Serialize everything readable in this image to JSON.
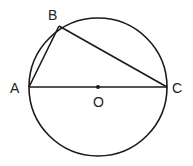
{
  "diagram": {
    "type": "geometry",
    "colors": {
      "stroke": "#1a1a1a",
      "label": "#222222",
      "background": "#ffffff"
    },
    "circle": {
      "center": "O",
      "cx": 98,
      "cy": 87,
      "r": 69
    },
    "points": [
      {
        "name": "A",
        "label": "A",
        "x": 29,
        "y": 87
      },
      {
        "name": "B",
        "label": "B",
        "x": 59,
        "y": 26
      },
      {
        "name": "C",
        "label": "C",
        "x": 167,
        "y": 87
      },
      {
        "name": "O",
        "label": "O",
        "x": 98,
        "y": 87
      }
    ],
    "segments": [
      [
        "A",
        "B"
      ],
      [
        "B",
        "C"
      ],
      [
        "A",
        "C"
      ]
    ]
  }
}
